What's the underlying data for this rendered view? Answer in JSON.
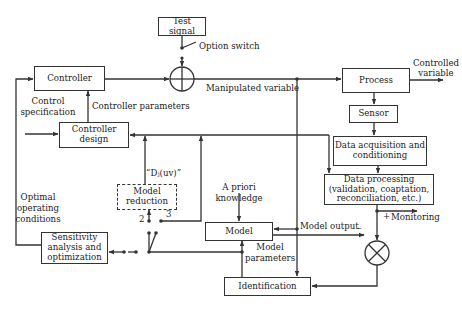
{
  "diagram": {
    "type": "block-diagram",
    "title": "",
    "blocks": {
      "test_signal": "Test signal",
      "controller": "Controller",
      "process": "Process",
      "sensor": "Sensor",
      "data_acquisition": "Data acquisition and conditioning",
      "data_processing": "Data processing (validation, coaptation, reconciliation, etc.)",
      "controller_design": "Controller design",
      "model_reduction": "Model reduction",
      "model": "Model",
      "identification": "Identification",
      "sensitivity": "Sensitivity analysis and optimization"
    },
    "labels": {
      "option_switch": "Option switch",
      "manipulated_variable": "Manipulated variable",
      "controlled_variable_1": "Controlled",
      "controlled_variable_2": "variable",
      "control_specification_1": "Control",
      "control_specification_2": "specification",
      "controller_parameters": "Controller parameters",
      "d_uv": "“Dⱼ(uv)”",
      "a_priori_1": "A priori",
      "a_priori_2": "knowledge",
      "optimal_1": "Optimal",
      "optimal_2": "operating",
      "optimal_3": "conditions",
      "switch_pos_2": "2",
      "switch_pos_3": "3",
      "model_output": "Model output",
      "minus_sign": "–",
      "plus_sign": "+",
      "monitoring": "Monitoring",
      "model_parameters_1": "Model",
      "model_parameters_2": "parameters"
    },
    "blocks_multiline": {
      "data_acquisition": [
        "Data acquisition and",
        "conditioning"
      ],
      "data_processing": [
        "Data processing",
        "(validation, coaptation,",
        "reconciliation, etc.)"
      ],
      "controller_design": [
        "Controller",
        "design"
      ],
      "model_reduction": [
        "Model",
        "reduction"
      ],
      "sensitivity": [
        "Sensitivity",
        "analysis and",
        "optimization"
      ]
    },
    "nodes": {
      "summing_junction": "sum (+)",
      "comparator": "difference (×)"
    },
    "edges": [
      {
        "from": "Test signal",
        "to": "summing junction",
        "via": "Option switch"
      },
      {
        "from": "Controller",
        "to": "summing junction"
      },
      {
        "from": "summing junction",
        "to": "Process",
        "label": "Manipulated variable"
      },
      {
        "from": "Process",
        "to": "output",
        "label": "Controlled variable"
      },
      {
        "from": "Process",
        "to": "Sensor"
      },
      {
        "from": "Sensor",
        "to": "Data acquisition and conditioning"
      },
      {
        "from": "Data acquisition and conditioning",
        "to": "Data processing"
      },
      {
        "from": "Data processing",
        "to": "Monitoring"
      },
      {
        "from": "Data processing",
        "to": "comparator",
        "sign": "+"
      },
      {
        "from": "Model",
        "to": "comparator",
        "label": "Model output",
        "sign": "-"
      },
      {
        "from": "comparator",
        "to": "Identification"
      },
      {
        "from": "Identification",
        "to": "Model",
        "label": "Model parameters"
      },
      {
        "from": "Manipulated variable",
        "to": "Identification"
      },
      {
        "from": "Manipulated variable",
        "to": "Model"
      },
      {
        "from": "A priori knowledge",
        "to": "Model"
      },
      {
        "from": "Model parameters",
        "to": "switch"
      },
      {
        "from": "switch pos 2",
        "to": "Model reduction"
      },
      {
        "from": "switch pos 3",
        "to": "Controller design"
      },
      {
        "from": "Model reduction",
        "to": "Controller design",
        "label": "“Dj(uv)”"
      },
      {
        "from": "switch",
        "to": "Sensitivity analysis and optimization"
      },
      {
        "from": "Sensitivity analysis and optimization",
        "to": "Controller",
        "label": "Optimal operating conditions"
      },
      {
        "from": "Control specification",
        "to": "Controller design"
      },
      {
        "from": "Controller design",
        "to": "Controller",
        "label": "Controller parameters"
      },
      {
        "from": "Data acquisition and conditioning",
        "to": "Controller design"
      }
    ]
  }
}
